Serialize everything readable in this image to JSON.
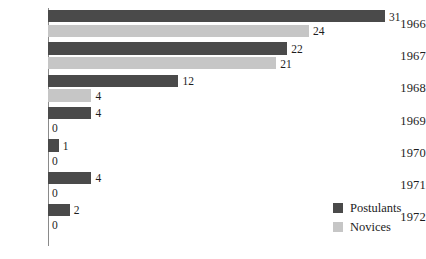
{
  "chart_data": {
    "type": "bar",
    "orientation": "horizontal",
    "title": "",
    "subtitle": "",
    "xlabel": "",
    "ylabel": "",
    "grid": false,
    "legend_position": "bottom-right",
    "axis_visible": "y-axis-only",
    "xlim": [
      0,
      31
    ],
    "categories": [
      "1966",
      "1967",
      "1968",
      "1969",
      "1970",
      "1971",
      "1972"
    ],
    "series": [
      {
        "name": "Postulants",
        "color": "#4a4a4a",
        "values": [
          31,
          22,
          12,
          4,
          1,
          4,
          2
        ]
      },
      {
        "name": "Novices",
        "color": "#c6c6c6",
        "values": [
          24,
          21,
          4,
          0,
          0,
          0,
          0
        ]
      }
    ],
    "value_labels": {
      "Postulants": [
        "31",
        "22",
        "12",
        "4",
        "1",
        "4",
        "2"
      ],
      "Novices": [
        "24",
        "21",
        "4",
        "0",
        "0",
        "0",
        "0"
      ]
    }
  },
  "legend": {
    "items": [
      {
        "label": "Postulants",
        "color": "#4a4a4a"
      },
      {
        "label": "Novices",
        "color": "#c6c6c6"
      }
    ]
  },
  "colors": {
    "postulants": "#4a4a4a",
    "novices": "#c6c6c6",
    "axis": "#8a8a8a",
    "text": "#1d1d1d",
    "background": "#ffffff"
  }
}
